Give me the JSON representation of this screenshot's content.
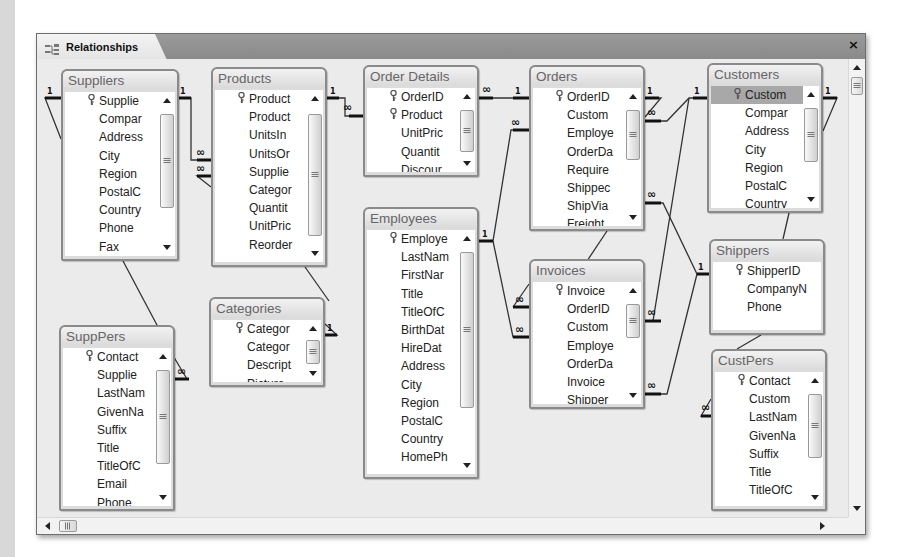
{
  "window": {
    "tab_label": "Relationships",
    "tab_icon": "relationships-icon",
    "close_label": "×"
  },
  "tables": [
    {
      "id": "suppliers",
      "title": "Suppliers",
      "x": 24,
      "y": 10,
      "w": 118,
      "h": 192,
      "thumb_top": 22,
      "thumb_h": 94,
      "fields": [
        {
          "name": "Supplie",
          "key": true
        },
        {
          "name": "Compar"
        },
        {
          "name": "Address"
        },
        {
          "name": "City"
        },
        {
          "name": "Region"
        },
        {
          "name": "PostalC"
        },
        {
          "name": "Country"
        },
        {
          "name": "Phone"
        },
        {
          "name": "Fax"
        }
      ]
    },
    {
      "id": "products",
      "title": "Products",
      "x": 174,
      "y": 8,
      "w": 116,
      "h": 200,
      "thumb_top": 24,
      "thumb_h": 122,
      "fields": [
        {
          "name": "Product",
          "key": true
        },
        {
          "name": "Product"
        },
        {
          "name": "UnitsIn"
        },
        {
          "name": "UnitsOr"
        },
        {
          "name": "Supplie"
        },
        {
          "name": "Categor"
        },
        {
          "name": "Quantit"
        },
        {
          "name": "UnitPric"
        },
        {
          "name": "Reorder"
        }
      ]
    },
    {
      "id": "order-details",
      "title": "Order Details",
      "x": 326,
      "y": 6,
      "w": 116,
      "h": 112,
      "thumb_top": 22,
      "thumb_h": 42,
      "fields": [
        {
          "name": "OrderID",
          "key": true
        },
        {
          "name": "Product",
          "key": true
        },
        {
          "name": "UnitPric"
        },
        {
          "name": "Quantit"
        },
        {
          "name": "Discour"
        }
      ]
    },
    {
      "id": "orders",
      "title": "Orders",
      "x": 492,
      "y": 6,
      "w": 116,
      "h": 166,
      "thumb_top": 22,
      "thumb_h": 50,
      "fields": [
        {
          "name": "OrderID",
          "key": true
        },
        {
          "name": "Custom"
        },
        {
          "name": "Employe"
        },
        {
          "name": "OrderDa"
        },
        {
          "name": "Require"
        },
        {
          "name": "Shippec"
        },
        {
          "name": "ShipVia"
        },
        {
          "name": "Freight"
        }
      ]
    },
    {
      "id": "customers",
      "title": "Customers",
      "x": 670,
      "y": 4,
      "w": 116,
      "h": 150,
      "selected_row": 0,
      "thumb_top": 22,
      "thumb_h": 54,
      "fields": [
        {
          "name": "Custom",
          "key": true
        },
        {
          "name": "Compar"
        },
        {
          "name": "Address"
        },
        {
          "name": "City"
        },
        {
          "name": "Region"
        },
        {
          "name": "PostalC"
        },
        {
          "name": "Country"
        }
      ]
    },
    {
      "id": "employees",
      "title": "Employees",
      "x": 326,
      "y": 148,
      "w": 116,
      "h": 272,
      "thumb_top": 22,
      "thumb_h": 156,
      "fields": [
        {
          "name": "Employe",
          "key": true
        },
        {
          "name": "LastNam"
        },
        {
          "name": "FirstNar"
        },
        {
          "name": "Title"
        },
        {
          "name": "TitleOfC"
        },
        {
          "name": "BirthDat"
        },
        {
          "name": "HireDat"
        },
        {
          "name": "Address"
        },
        {
          "name": "City"
        },
        {
          "name": "Region"
        },
        {
          "name": "PostalC"
        },
        {
          "name": "Country"
        },
        {
          "name": "HomePh"
        }
      ]
    },
    {
      "id": "invoices",
      "title": "Invoices",
      "x": 492,
      "y": 200,
      "w": 116,
      "h": 150,
      "thumb_top": 22,
      "thumb_h": 34,
      "fields": [
        {
          "name": "Invoice",
          "key": true
        },
        {
          "name": "OrderID"
        },
        {
          "name": "Custom"
        },
        {
          "name": "Employe"
        },
        {
          "name": "OrderDa"
        },
        {
          "name": "Invoice"
        },
        {
          "name": "Shipper"
        }
      ]
    },
    {
      "id": "shippers",
      "title": "Shippers",
      "x": 672,
      "y": 180,
      "w": 116,
      "h": 96,
      "noscroll": true,
      "fields": [
        {
          "name": "ShipperID",
          "key": true
        },
        {
          "name": "CompanyN"
        },
        {
          "name": "Phone"
        }
      ]
    },
    {
      "id": "categories",
      "title": "Categories",
      "x": 172,
      "y": 238,
      "w": 116,
      "h": 90,
      "thumb_top": 20,
      "thumb_h": 24,
      "fields": [
        {
          "name": "Categor",
          "key": true
        },
        {
          "name": "Categor"
        },
        {
          "name": "Descript"
        },
        {
          "name": "Picture"
        }
      ]
    },
    {
      "id": "supppers",
      "title": "SuppPers",
      "x": 22,
      "y": 266,
      "w": 116,
      "h": 186,
      "thumb_top": 22,
      "thumb_h": 94,
      "fields": [
        {
          "name": "Contact",
          "key": true
        },
        {
          "name": "Supplie"
        },
        {
          "name": "LastNam"
        },
        {
          "name": "GivenNa"
        },
        {
          "name": "Suffix"
        },
        {
          "name": "Title"
        },
        {
          "name": "TitleOfC"
        },
        {
          "name": "Email"
        },
        {
          "name": "Phone"
        }
      ]
    },
    {
      "id": "custpers",
      "title": "CustPers",
      "x": 674,
      "y": 290,
      "w": 116,
      "h": 162,
      "thumb_top": 22,
      "thumb_h": 64,
      "fields": [
        {
          "name": "Contact",
          "key": true
        },
        {
          "name": "Custom"
        },
        {
          "name": "LastNam"
        },
        {
          "name": "GivenNa"
        },
        {
          "name": "Suffix"
        },
        {
          "name": "Title"
        },
        {
          "name": "TitleOfC"
        }
      ]
    }
  ],
  "relationship_labels": {
    "one": "1",
    "many": "∞"
  },
  "scrollbars": {
    "vertical": "canvas-vertical-scrollbar",
    "horizontal": "canvas-horizontal-scrollbar"
  }
}
